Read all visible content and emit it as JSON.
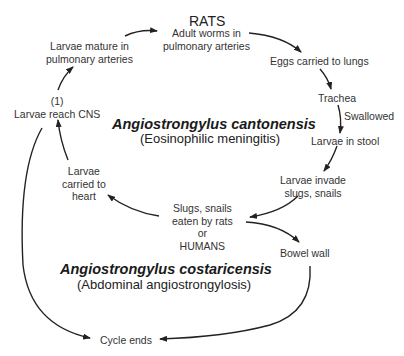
{
  "host_title": "RATS",
  "nodes": {
    "adult_worms": [
      "Adult worms in",
      "pulmonary arteries"
    ],
    "eggs_lungs": "Eggs carried to lungs",
    "trachea": "Trachea",
    "swallowed": "Swallowed",
    "larvae_stool": "Larvae in stool",
    "larvae_invade": [
      "Larvae invade",
      "slugs, snails"
    ],
    "slugs_eaten": [
      "Slugs, snails",
      "eaten by rats",
      "or",
      "HUMANS"
    ],
    "bowel_wall": "Bowel wall",
    "cycle_ends": "Cycle ends",
    "larvae_heart": [
      "Larvae",
      "carried to",
      "heart"
    ],
    "larvae_cns_marker": "(1)",
    "larvae_cns": "Larvae reach CNS",
    "larvae_mature": [
      "Larvae mature  in",
      "pulmonary arteries"
    ]
  },
  "species": {
    "cantonensis": {
      "name": "Angiostrongylus cantonensis",
      "disease": "(Eosinophilic meningitis)"
    },
    "costaricensis": {
      "name": "Angiostrongylus costaricensis",
      "disease": "(Abdominal angiostrongylosis)"
    }
  }
}
